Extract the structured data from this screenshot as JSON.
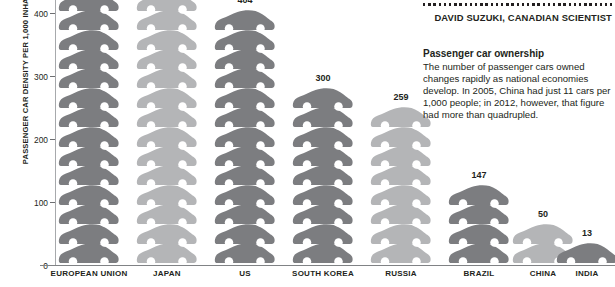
{
  "chart_data": {
    "type": "bar",
    "title": "Passenger car ownership",
    "xlabel": "",
    "ylabel": "PASSENGER CAR DENSITY PER 1,000 INHABITANTS",
    "ylim": [
      0,
      420
    ],
    "grid": false,
    "legend_position": "none",
    "pictogram_unit_value": 31,
    "y_ticks": [
      "0",
      "100",
      "200",
      "300",
      "400"
    ],
    "categories": [
      "EUROPEAN UNION",
      "JAPAN",
      "US",
      "SOUTH KOREA",
      "RUSSIA",
      "BRAZIL",
      "CHINA",
      "INDIA"
    ],
    "values": [
      420,
      420,
      404,
      300,
      259,
      147,
      50,
      13
    ],
    "value_labels": [
      "",
      "",
      "404",
      "300",
      "259",
      "147",
      "50",
      "13"
    ],
    "series": [
      {
        "name": "Passenger cars per 1,000 inhabitants",
        "values": [
          420,
          420,
          404,
          300,
          259,
          147,
          50,
          13
        ]
      }
    ]
  },
  "axis": {
    "y_title": "PASSENGER CAR DENSITY PER 1,000 INHABITANTS",
    "ticks": [
      {
        "label": "400",
        "value": 400
      },
      {
        "label": "300",
        "value": 300
      },
      {
        "label": "200",
        "value": 200
      },
      {
        "label": "100",
        "value": 100
      },
      {
        "label": "0",
        "value": 0
      }
    ]
  },
  "columns": [
    {
      "label": "EUROPEAN UNION",
      "value_label": "",
      "value": 420,
      "cars": 14,
      "tone": "dark"
    },
    {
      "label": "JAPAN",
      "value_label": "",
      "value": 420,
      "cars": 14,
      "tone": "light"
    },
    {
      "label": "US",
      "value_label": "404",
      "value": 404,
      "cars": 13,
      "tone": "dark"
    },
    {
      "label": "SOUTH KOREA",
      "value_label": "300",
      "value": 300,
      "cars": 9,
      "tone": "dark"
    },
    {
      "label": "RUSSIA",
      "value_label": "259",
      "value": 259,
      "cars": 8,
      "tone": "light"
    },
    {
      "label": "BRAZIL",
      "value_label": "147",
      "value": 147,
      "cars": 4,
      "tone": "dark"
    },
    {
      "label": "CHINA",
      "value_label": "50",
      "value": 50,
      "cars": 2,
      "tone": "light"
    },
    {
      "label": "INDIA",
      "value_label": "13",
      "value": 13,
      "cars": 1,
      "tone": "dark"
    }
  ],
  "sidebar": {
    "attribution": "DAVID SUZUKI, CANADIAN SCIENTIST",
    "blurb_title": "Passenger car ownership",
    "blurb_body": "The number of passenger cars owned changes rapidly as national economies develop. In 2005, China had just 11 cars per 1,000 people; in 2012, however, that figure had more than quadrupled."
  },
  "colors": {
    "car_dark": "#7c7d80",
    "car_light": "#b4b5b7",
    "wheel": "#ffffff",
    "text": "#231f20",
    "axis": "#808285",
    "tick": "#6d6e71"
  }
}
